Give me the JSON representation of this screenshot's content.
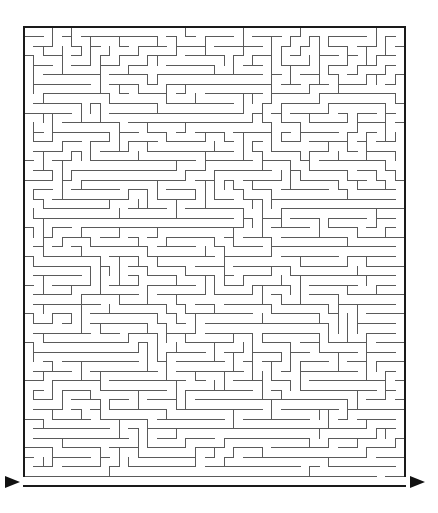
{
  "puzzle": {
    "type": "maze",
    "grid": {
      "cols": 40,
      "rows": 48
    },
    "bounds": {
      "left": 24,
      "top": 27,
      "right": 405,
      "bottom": 486
    },
    "seed": 73129,
    "colors": {
      "wall": "#5a5a5a",
      "border": "#1a1a1a",
      "arrow": "#111111",
      "background": "#ffffff"
    },
    "entrance": {
      "side": "left",
      "row": 47,
      "arrow": {
        "x": 5,
        "y": 482,
        "direction": "right"
      }
    },
    "exit": {
      "side": "right",
      "row": 47,
      "arrow": {
        "x": 410,
        "y": 482,
        "direction": "right"
      }
    },
    "bottom_corridor": {
      "row": 47,
      "description": "long open corridor along bottom leading from entrance arrow to exit arrow"
    }
  }
}
